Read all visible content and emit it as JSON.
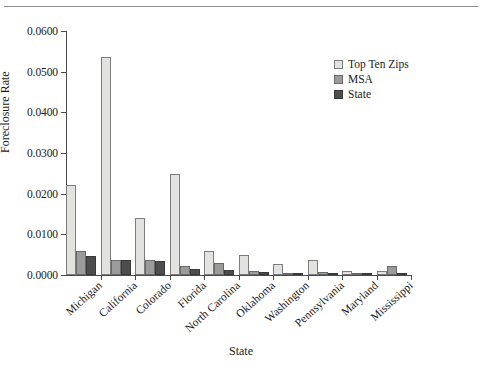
{
  "chart_data": {
    "type": "bar",
    "title": "",
    "xlabel": "State",
    "ylabel": "Foreclosure Rate",
    "ylim": [
      0.0,
      0.06
    ],
    "ytick_labels": [
      "0.0000",
      "0.0100",
      "0.0200",
      "0.0300",
      "0.0400",
      "0.0500",
      "0.0600"
    ],
    "ytick_values": [
      0.0,
      0.01,
      0.02,
      0.03,
      0.04,
      0.05,
      0.06
    ],
    "grid": false,
    "legend_position": "upper right",
    "categories": [
      "Michigan",
      "California",
      "Colorado",
      "Florida",
      "North Carolina",
      "Oklahoma",
      "Washington",
      "Pennsylvania",
      "Maryland",
      "Mississippi"
    ],
    "series": [
      {
        "name": "Top Ten Zips",
        "color": "#e2e2e0",
        "values": [
          0.0221,
          0.0537,
          0.0139,
          0.0249,
          0.0059,
          0.005,
          0.0027,
          0.0036,
          0.0009,
          0.0011
        ]
      },
      {
        "name": "MSA",
        "color": "#9b9b9b",
        "values": [
          0.0059,
          0.0038,
          0.0037,
          0.0022,
          0.003,
          0.0011,
          0.0004,
          0.0008,
          0.0002,
          0.0021
        ]
      },
      {
        "name": "State",
        "color": "#4d4d4d",
        "values": [
          0.0047,
          0.0036,
          0.0034,
          0.0015,
          0.0013,
          0.0008,
          0.0003,
          0.0004,
          0.0002,
          0.0003
        ]
      }
    ]
  },
  "legend": {
    "items": [
      {
        "label": "Top Ten Zips",
        "swatch": "zips"
      },
      {
        "label": "MSA",
        "swatch": "msa"
      },
      {
        "label": "State",
        "swatch": "state"
      }
    ]
  }
}
